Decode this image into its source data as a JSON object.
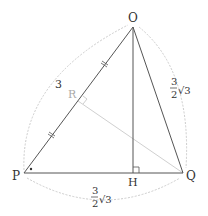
{
  "diagram": {
    "points": {
      "O": {
        "label": "O",
        "x": 133,
        "y": 27
      },
      "P": {
        "label": "P",
        "x": 24,
        "y": 173
      },
      "Q": {
        "label": "Q",
        "x": 183,
        "y": 173
      },
      "H": {
        "label": "H",
        "x": 133,
        "y": 173
      },
      "R": {
        "label": "R",
        "x": 78,
        "y": 100
      }
    },
    "edge_labels": {
      "OP": {
        "text": "3"
      },
      "OQ": {
        "numerator": "3",
        "denominator": "2",
        "radical": "√3"
      },
      "PQ": {
        "numerator": "3",
        "denominator": "2",
        "radical": "√3"
      }
    },
    "colors": {
      "line": "#555555",
      "light_line": "#cccccc",
      "arc": "#cccccc",
      "label": "#333333",
      "label_light": "#aaaaaa"
    }
  }
}
